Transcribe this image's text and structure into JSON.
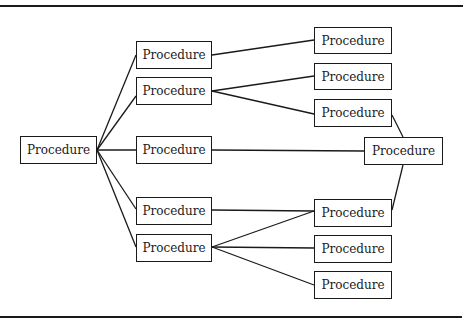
{
  "diagram": {
    "line_color": "#1a1a1a",
    "nodes": [
      {
        "id": "root",
        "label": "Procedure",
        "x": 20,
        "y": 136,
        "w": 77,
        "h": 28
      },
      {
        "id": "c2a",
        "label": "Procedure",
        "x": 136,
        "y": 41,
        "w": 76,
        "h": 28
      },
      {
        "id": "c2b",
        "label": "Procedure",
        "x": 136,
        "y": 77,
        "w": 76,
        "h": 28
      },
      {
        "id": "c2c",
        "label": "Procedure",
        "x": 136,
        "y": 136,
        "w": 76,
        "h": 28
      },
      {
        "id": "c2d",
        "label": "Procedure",
        "x": 136,
        "y": 197,
        "w": 76,
        "h": 28
      },
      {
        "id": "c2e",
        "label": "Procedure",
        "x": 136,
        "y": 234,
        "w": 76,
        "h": 28
      },
      {
        "id": "c3a",
        "label": "Procedure",
        "x": 314,
        "y": 27,
        "w": 78,
        "h": 27
      },
      {
        "id": "c3b",
        "label": "Procedure",
        "x": 314,
        "y": 63,
        "w": 78,
        "h": 27
      },
      {
        "id": "c3c",
        "label": "Procedure",
        "x": 314,
        "y": 99,
        "w": 78,
        "h": 28
      },
      {
        "id": "c3d",
        "label": "Procedure",
        "x": 314,
        "y": 199,
        "w": 78,
        "h": 28
      },
      {
        "id": "c3e",
        "label": "Procedure",
        "x": 314,
        "y": 235,
        "w": 78,
        "h": 28
      },
      {
        "id": "c3f",
        "label": "Procedure",
        "x": 314,
        "y": 271,
        "w": 78,
        "h": 28
      },
      {
        "id": "right",
        "label": "Procedure",
        "x": 364,
        "y": 137,
        "w": 79,
        "h": 28
      }
    ],
    "edges": [
      {
        "from": "root",
        "to": "c2a"
      },
      {
        "from": "root",
        "to": "c2b"
      },
      {
        "from": "root",
        "to": "c2c"
      },
      {
        "from": "root",
        "to": "c2d"
      },
      {
        "from": "root",
        "to": "c2e"
      },
      {
        "from": "c2a",
        "to": "c3a"
      },
      {
        "from": "c2b",
        "to": "c3b"
      },
      {
        "from": "c2b",
        "to": "c3c"
      },
      {
        "from": "c2c",
        "to": "right"
      },
      {
        "from": "c2d",
        "to": "c3d"
      },
      {
        "from": "c2e",
        "to": "c3d"
      },
      {
        "from": "c2e",
        "to": "c3e"
      },
      {
        "from": "c2e",
        "to": "c3f"
      },
      {
        "from": "c3c",
        "to": "right"
      },
      {
        "from": "c3d",
        "to": "right"
      }
    ]
  }
}
